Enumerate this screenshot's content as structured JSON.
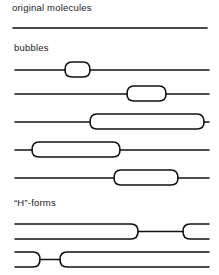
{
  "sections": {
    "original": {
      "label": "original molecules"
    },
    "bubbles": {
      "label": "bubbles",
      "rows": [
        {
          "bubble_start_x": 65,
          "bubble_end_x": 90
        },
        {
          "bubble_start_x": 127,
          "bubble_end_x": 166
        },
        {
          "bubble_start_x": 90,
          "bubble_end_x": 204
        },
        {
          "bubble_start_x": 32,
          "bubble_end_x": 120
        },
        {
          "bubble_start_x": 114,
          "bubble_end_x": 178
        }
      ]
    },
    "hforms": {
      "label": "“H”-forms",
      "rows": [
        {
          "left_closed_end_x": 138,
          "right_open_start_x": 183
        },
        {
          "left_open_end_x": 40,
          "right_closed_start_x": 60
        }
      ]
    }
  },
  "colors": {
    "line": "#111111",
    "text": "#1a1a1a",
    "background": "#ffffff"
  }
}
